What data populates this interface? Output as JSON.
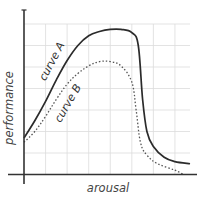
{
  "chart_data": {
    "type": "line",
    "title": "",
    "xlabel": "arousal",
    "ylabel": "performance",
    "grid": true,
    "legend": "inline labels on curves",
    "xlim": [
      0,
      8
    ],
    "ylim": [
      0,
      7
    ],
    "x_ticks": [],
    "y_ticks": [],
    "series": [
      {
        "name": "curve A",
        "style": "solid",
        "color": "#2b2b2b",
        "points": [
          [
            0.0,
            1.7
          ],
          [
            0.5,
            2.5
          ],
          [
            1.0,
            3.4
          ],
          [
            1.5,
            4.4
          ],
          [
            2.0,
            5.3
          ],
          [
            2.5,
            6.0
          ],
          [
            3.0,
            6.45
          ],
          [
            3.5,
            6.65
          ],
          [
            4.0,
            6.75
          ],
          [
            4.5,
            6.75
          ],
          [
            5.0,
            6.6
          ],
          [
            5.3,
            6.0
          ],
          [
            5.5,
            3.5
          ],
          [
            5.7,
            2.0
          ],
          [
            6.0,
            1.3
          ],
          [
            6.5,
            0.8
          ],
          [
            7.0,
            0.6
          ],
          [
            7.7,
            0.5
          ]
        ]
      },
      {
        "name": "curve B",
        "style": "dotted",
        "color": "#555555",
        "points": [
          [
            0.0,
            1.5
          ],
          [
            0.5,
            2.0
          ],
          [
            1.0,
            2.7
          ],
          [
            1.5,
            3.5
          ],
          [
            2.0,
            4.2
          ],
          [
            2.5,
            4.7
          ],
          [
            3.0,
            5.05
          ],
          [
            3.5,
            5.25
          ],
          [
            4.0,
            5.25
          ],
          [
            4.5,
            5.05
          ],
          [
            5.0,
            4.3
          ],
          [
            5.2,
            3.0
          ],
          [
            5.4,
            1.5
          ],
          [
            5.7,
            0.9
          ],
          [
            6.2,
            0.5
          ],
          [
            7.0,
            0.2
          ],
          [
            7.4,
            0.0
          ]
        ]
      }
    ],
    "annotations": [
      {
        "text": "curve A",
        "x": 1.3,
        "y": 5.0,
        "rotation": -62
      },
      {
        "text": "curve B",
        "x": 2.0,
        "y": 3.0,
        "rotation": -60
      }
    ]
  },
  "labels": {
    "xlabel": "arousal",
    "ylabel": "performance",
    "curve_a": "curve A",
    "curve_b": "curve B"
  }
}
